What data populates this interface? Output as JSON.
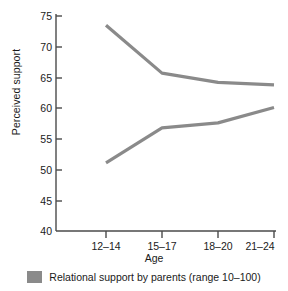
{
  "chart_data": {
    "type": "line",
    "title": "",
    "xlabel": "Age",
    "ylabel": "Perceived support",
    "categories": [
      "12–14",
      "15–17",
      "18–20",
      "21–24"
    ],
    "ylim": [
      40,
      75
    ],
    "yticks": [
      40,
      45,
      50,
      55,
      60,
      65,
      70,
      75
    ],
    "ytick_labels": [
      "40",
      "45",
      "50",
      "55",
      "60",
      "65",
      "70",
      "75"
    ],
    "grid": false,
    "legend_position": "bottom-center",
    "series": [
      {
        "name": "Relational support by parents (range 10–100)",
        "values": [
          73.5,
          65.7,
          64.2,
          63.8
        ],
        "color": "#8a8a8a"
      },
      {
        "name": "Relational support by parents (range 10–100)",
        "values": [
          51.1,
          56.8,
          57.6,
          60.1
        ],
        "color": "#8a8a8a"
      }
    ],
    "legend": [
      {
        "label": "Relational support by parents (range 10–100)",
        "color": "#8a8a8a"
      }
    ]
  },
  "axes": {
    "y_title": "Perceived support",
    "x_title": "Age",
    "y_tick_labels": [
      "75",
      "70",
      "65",
      "60",
      "55",
      "50",
      "45",
      "40"
    ],
    "x_tick_labels": [
      "12–14",
      "15–17",
      "18–20",
      "21–24"
    ]
  },
  "legend": {
    "label": "Relational support by parents (range 10–100)",
    "swatch_color": "#8a8a8a"
  },
  "colors": {
    "line": "#8a8a8a",
    "axis": "#4a4a4a",
    "text": "#1a1a1a",
    "background": "#ffffff"
  }
}
